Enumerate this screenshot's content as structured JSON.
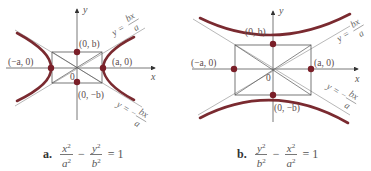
{
  "figure": {
    "panels": [
      {
        "id": "a",
        "orientation": "horizontal-transverse-axis",
        "axes": {
          "x_label": "x",
          "y_label": "y",
          "origin_label": "0"
        },
        "vertices": [
          "(−a, 0)",
          "(a, 0)"
        ],
        "co_vertices": [
          "(0, b)",
          "(0, −b)"
        ],
        "asymptotes": {
          "upper": {
            "prefix": "y =",
            "num": "bx",
            "den": "a"
          },
          "lower": {
            "prefix": "y = −",
            "num": "bx",
            "den": "a"
          }
        },
        "caption": {
          "tag": "a.",
          "t1_num": "x",
          "t1_den": "a",
          "op": "−",
          "t2_num": "y",
          "t2_den": "b",
          "exp": "2",
          "rhs": "= 1"
        }
      },
      {
        "id": "b",
        "orientation": "vertical-transverse-axis",
        "axes": {
          "x_label": "x",
          "y_label": "y",
          "origin_label": "0"
        },
        "vertices": [
          "(0, b)",
          "(0, −b)"
        ],
        "co_vertices": [
          "(−a, 0)",
          "(a, 0)"
        ],
        "asymptotes": {
          "upper": {
            "prefix": "y =",
            "num": "bx",
            "den": "a"
          },
          "lower": {
            "prefix": "y = −",
            "num": "bx",
            "den": "a"
          }
        },
        "caption": {
          "tag": "b.",
          "t1_num": "y",
          "t1_den": "b",
          "op": "−",
          "t2_num": "x",
          "t2_den": "a",
          "exp": "2",
          "rhs": "= 1"
        }
      }
    ],
    "colors": {
      "curve": "#7a2a30",
      "point": "#7a1f28",
      "lines": "#555555",
      "asymptote": "#8a8a8a"
    }
  }
}
